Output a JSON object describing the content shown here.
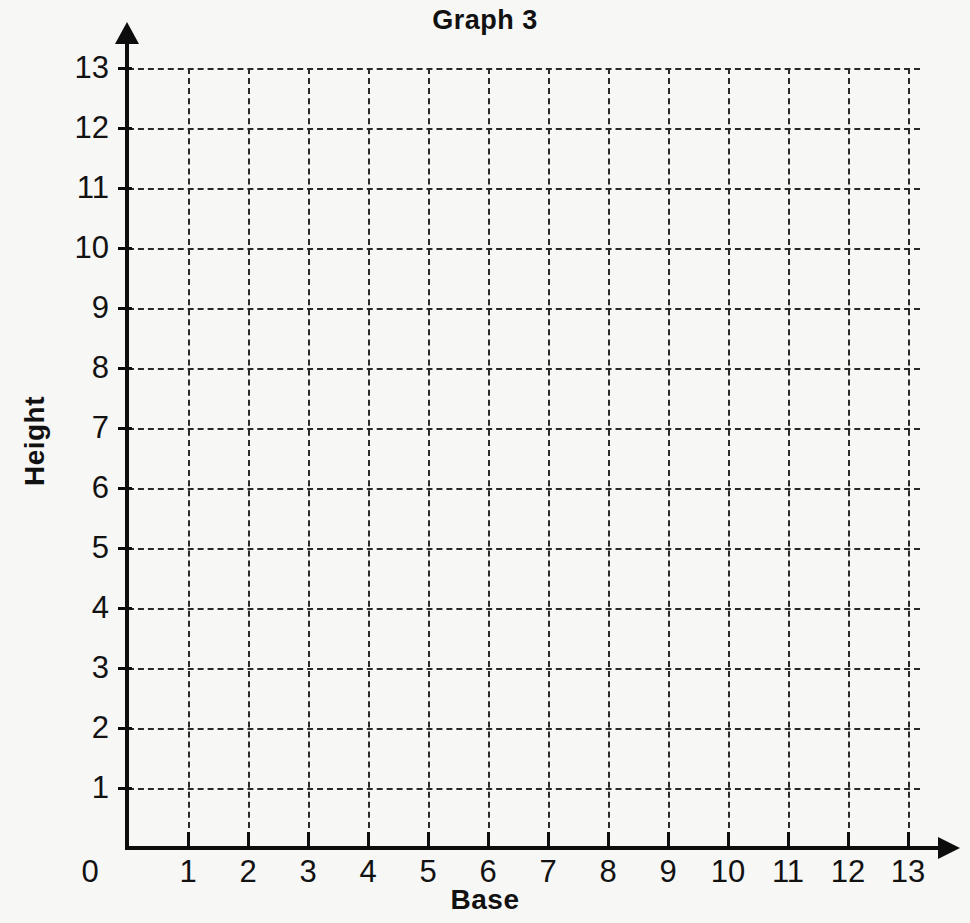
{
  "chart_data": {
    "type": "scatter",
    "title": "Graph 3",
    "xlabel": "Base",
    "ylabel": "Height",
    "x": [],
    "values": [],
    "series": [],
    "xlim": [
      0,
      13
    ],
    "ylim": [
      0,
      13
    ],
    "xticks": [
      0,
      1,
      2,
      3,
      4,
      5,
      6,
      7,
      8,
      9,
      10,
      11,
      12,
      13
    ],
    "yticks": [
      0,
      1,
      2,
      3,
      4,
      5,
      6,
      7,
      8,
      9,
      10,
      11,
      12,
      13
    ],
    "xtick_labels": [
      "0",
      "1",
      "2",
      "3",
      "4",
      "5",
      "6",
      "7",
      "8",
      "9",
      "10",
      "11",
      "12",
      "13"
    ],
    "ytick_labels": [
      "1",
      "2",
      "3",
      "4",
      "5",
      "6",
      "7",
      "8",
      "9",
      "10",
      "11",
      "12",
      "13"
    ],
    "grid": true,
    "grid_style": "dashed",
    "legend": false,
    "annotations": [],
    "note": "Empty coordinate grid worksheet; no data plotted."
  },
  "colors": {
    "background": "#f7f7f5",
    "axis": "#0d0d0d",
    "gridline": "#2a2a2a",
    "text": "#111111"
  },
  "axes": {
    "x_arrow": "arrow-right-icon",
    "y_arrow": "arrow-up-icon"
  }
}
